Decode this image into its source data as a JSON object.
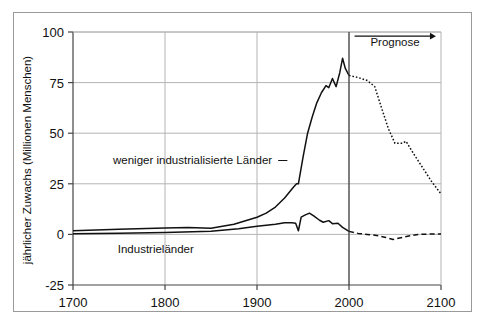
{
  "chart_data": {
    "type": "line",
    "title": "",
    "subtitle": "",
    "xlabel": "",
    "ylabel": "jährlicher Zuwachs (Millionen Menschen)",
    "xlim": [
      1700,
      2100
    ],
    "ylim": [
      -25,
      100
    ],
    "xticks": [
      1700,
      1800,
      1900,
      2000,
      2100
    ],
    "xtick_labels": [
      "1700",
      "1800",
      "1900",
      "2000",
      "2100"
    ],
    "yticks": [
      -25,
      0,
      25,
      50,
      75,
      100
    ],
    "ytick_labels": [
      "-25",
      "0",
      "25",
      "50",
      "75",
      "100"
    ],
    "grid": "horizontal-gridlines-at-y-0-25-50-75-100-and-vertical-at-x-1800-1900-2000",
    "legend_position": "inline-labels-on-plot",
    "colors": {
      "line": "#111111",
      "gridline": "#b4b4b4",
      "axis": "#444444",
      "frame": "#9a9a9a",
      "background": "#ffffff"
    },
    "annotations": [
      {
        "name": "prognose",
        "text": "Prognose",
        "x": 2050,
        "y": 93,
        "arrow": "right-arrow-below-text-from-2005-to-2080"
      },
      {
        "name": "forecast-divider",
        "text": "",
        "x": 2000,
        "note": "vertical solid line at year 2000 separating history from forecast"
      }
    ],
    "series": [
      {
        "name": "weniger industrialisierte Länder",
        "label": "weniger industrialisierte Länder",
        "label_x": 1830,
        "label_y": 37,
        "style_history": "solid",
        "style_forecast": "dotted",
        "x": [
          1700,
          1750,
          1800,
          1825,
          1850,
          1875,
          1900,
          1910,
          1920,
          1930,
          1940,
          1943,
          1945,
          1950,
          1955,
          1960,
          1965,
          1970,
          1975,
          1978,
          1982,
          1986,
          1990,
          1993,
          1996,
          2000
        ],
        "values": [
          1.8,
          2.5,
          3.2,
          3.4,
          3.0,
          5.0,
          8.5,
          10.5,
          13.5,
          18.0,
          23.5,
          25.0,
          25.0,
          38.0,
          50.0,
          58.0,
          65.0,
          70.0,
          73.5,
          72.5,
          77.0,
          73.0,
          80.0,
          87.0,
          82.0,
          78.5
        ],
        "x_forecast": [
          2000,
          2010,
          2020,
          2028,
          2035,
          2043,
          2050,
          2058,
          2062,
          2070,
          2080,
          2090,
          2100
        ],
        "values_forecast": [
          78.5,
          77.5,
          76.0,
          73.0,
          63.0,
          52.0,
          45.0,
          45.0,
          46.0,
          40.0,
          33.0,
          26.0,
          20.0
        ]
      },
      {
        "name": "Industrieländer",
        "label": "Industrieländer",
        "label_x": 1790,
        "label_y": -7,
        "style_history": "solid",
        "style_forecast": "dashed",
        "x": [
          1700,
          1750,
          1800,
          1850,
          1880,
          1900,
          1920,
          1930,
          1938,
          1942,
          1945,
          1948,
          1952,
          1957,
          1962,
          1968,
          1972,
          1978,
          1982,
          1988,
          1993,
          2000
        ],
        "values": [
          0.3,
          0.6,
          1.0,
          1.6,
          2.8,
          4.0,
          5.0,
          5.7,
          5.7,
          5.5,
          1.8,
          8.5,
          9.5,
          10.5,
          9.0,
          7.0,
          6.0,
          6.8,
          5.3,
          5.5,
          3.5,
          1.5
        ],
        "x_forecast": [
          2000,
          2010,
          2020,
          2030,
          2040,
          2048,
          2055,
          2065,
          2075,
          2090,
          2100
        ],
        "values_forecast": [
          1.5,
          0.5,
          0.0,
          -0.5,
          -1.5,
          -2.5,
          -1.8,
          -0.8,
          0.0,
          0.2,
          0.2
        ]
      }
    ]
  },
  "figure": {
    "plot_left": 73,
    "plot_right": 441,
    "plot_top": 32,
    "plot_bottom": 285
  }
}
